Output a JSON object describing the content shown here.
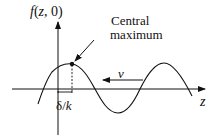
{
  "diagram": {
    "y_axis_label": "f(z, 0)",
    "x_axis_label": "z",
    "annotation": {
      "line1": "Central",
      "line2": "maximum"
    },
    "velocity_label": "v",
    "offset_label": "δ/k",
    "colors": {
      "stroke": "#111111",
      "background": "#ffffff"
    }
  }
}
